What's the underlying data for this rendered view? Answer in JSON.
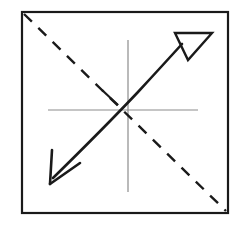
{
  "figure": {
    "background_color": "#ffffff",
    "canvas": {
      "width": 245,
      "height": 225
    }
  },
  "frame": {
    "name": "square-border",
    "color": "#1a1a1a",
    "stroke_width": 2.2,
    "x": 22,
    "y": 12,
    "width": 206,
    "height": 201
  },
  "axes": {
    "name": "crosshair-axes",
    "color": "#8c8c8c",
    "stroke_width": 1.2,
    "horizontal": {
      "x1": 48,
      "y1": 110,
      "x2": 198,
      "y2": 110
    },
    "vertical": {
      "x1": 128,
      "y1": 40,
      "x2": 128,
      "y2": 192
    },
    "origin": {
      "x": 128,
      "y": 110
    }
  },
  "dashed_diagonal": {
    "name": "dashed-diagonal-line",
    "color": "#1a1a1a",
    "stroke_width": 2.4,
    "dash_pattern": "11 9",
    "x1": 24,
    "y1": 14,
    "x2": 226,
    "y2": 211,
    "direction": "top-left to bottom-right"
  },
  "curve": {
    "name": "curved-arrow-shaft",
    "color": "#1a1a1a",
    "stroke_width": 2.6,
    "concavity": "concave-down",
    "start": {
      "x": 53,
      "y": 178
    },
    "control": {
      "x": 118,
      "y": 124
    },
    "end": {
      "x": 182,
      "y": 44
    },
    "path": "M53,178 Q104,128 138,92 Q162,66 182,44"
  },
  "arrow_head_upper": {
    "name": "hollow-triangle-arrowhead",
    "style": "open outline triangle",
    "color": "#1a1a1a",
    "fill": "none",
    "stroke_width": 2.4,
    "points": "175,33 212,33 188,60",
    "direction": "up-right"
  },
  "arrow_head_lower": {
    "name": "v-arrowhead",
    "style": "open V strokes",
    "color": "#1a1a1a",
    "stroke_width": 2.6,
    "tip": {
      "x": 50,
      "y": 184
    },
    "barb_left": {
      "x": 52,
      "y": 150
    },
    "barb_right": {
      "x": 80,
      "y": 163
    },
    "direction": "down-left"
  },
  "tick_mark": {
    "name": "curve-tick-mark",
    "color": "#1a1a1a",
    "stroke_width": 2.2,
    "x1": 102,
    "y1": 90,
    "x2": 118,
    "y2": 105
  }
}
